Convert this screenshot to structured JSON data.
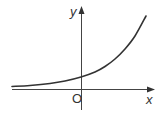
{
  "chart_data": {
    "type": "line",
    "title": "",
    "function": "exponential growth (y = a^x, a > 1)",
    "xlabel": "x",
    "ylabel": "y",
    "origin_label": "O",
    "grid": false,
    "legend": null,
    "axes": {
      "x_arrow": true,
      "y_arrow": true
    },
    "series": [
      {
        "name": "curve",
        "color": "#333333",
        "points_px": [
          [
            12,
            86.5
          ],
          [
            30,
            85.5
          ],
          [
            50,
            83.5
          ],
          [
            65,
            81
          ],
          [
            81,
            77
          ],
          [
            95,
            72
          ],
          [
            105,
            66.5
          ],
          [
            115,
            59
          ],
          [
            125,
            49
          ],
          [
            135,
            36
          ],
          [
            146,
            16
          ]
        ]
      }
    ]
  },
  "labels": {
    "x_axis": "x",
    "y_axis": "y",
    "origin": "O"
  },
  "colors": {
    "axis": "#444444",
    "curve": "#333333",
    "text": "#333333"
  }
}
